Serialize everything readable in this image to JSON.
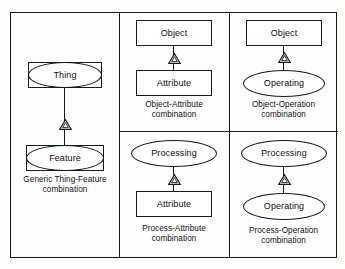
{
  "figure": {
    "background_color": "#fdfdfc",
    "line_color": "#1a1a1a"
  },
  "panels": [
    {
      "id": "generic",
      "caption_line1": "Generic Thing-Feature",
      "caption_line2": "combination",
      "parent": {
        "label": "Thing",
        "shape": "ellipse-in-rectangle"
      },
      "child": {
        "label": "Feature",
        "shape": "ellipse-in-rectangle"
      },
      "relation": "generalization-triangle"
    },
    {
      "id": "object-attribute",
      "caption_line1": "Object-Attribute",
      "caption_line2": "combination",
      "parent": {
        "label": "Object",
        "shape": "rectangle"
      },
      "child": {
        "label": "Attribute",
        "shape": "rectangle"
      },
      "relation": "generalization-triangle"
    },
    {
      "id": "object-operation",
      "caption_line1": "Object-Operation",
      "caption_line2": "combination",
      "parent": {
        "label": "Object",
        "shape": "rectangle"
      },
      "child": {
        "label": "Operating",
        "shape": "ellipse"
      },
      "relation": "generalization-triangle"
    },
    {
      "id": "process-attribute",
      "caption_line1": "Process-Attribute",
      "caption_line2": "combination",
      "parent": {
        "label": "Processing",
        "shape": "ellipse"
      },
      "child": {
        "label": "Attribute",
        "shape": "rectangle"
      },
      "relation": "generalization-triangle"
    },
    {
      "id": "process-operation",
      "caption_line1": "Process-Operation",
      "caption_line2": "combination",
      "parent": {
        "label": "Processing",
        "shape": "ellipse"
      },
      "child": {
        "label": "Operating",
        "shape": "ellipse"
      },
      "relation": "generalization-triangle"
    }
  ]
}
